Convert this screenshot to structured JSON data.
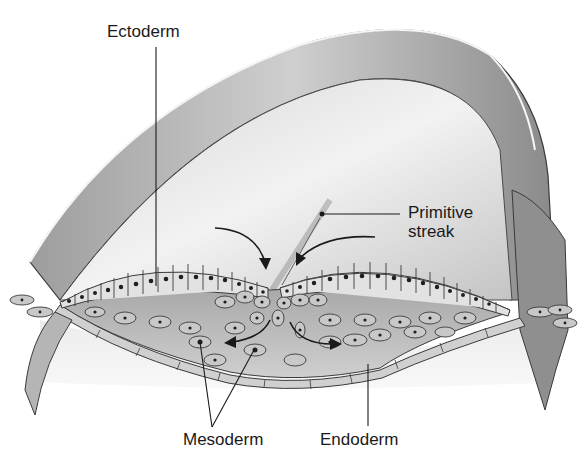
{
  "diagram": {
    "labels": {
      "ectoderm": "Ectoderm",
      "primitive_streak": [
        "Primitive",
        "streak"
      ],
      "mesoderm": "Mesoderm",
      "endoderm": "Endoderm"
    },
    "colors": {
      "outline": "#3a3a3a",
      "amnion_light": "#e6e6e6",
      "amnion_shadow": "#9a9a9a",
      "cell_fill": "#d4d4d4",
      "nucleus": "#1e1e1e",
      "mesoderm_space": "#bdbdbd",
      "background": "#ffffff"
    }
  }
}
